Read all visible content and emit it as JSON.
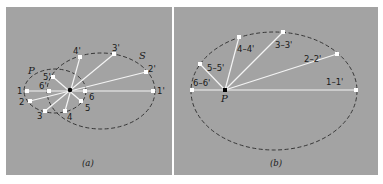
{
  "colors": {
    "background": "#ffffff",
    "panel": "#a3a3a3",
    "line": "#f4f4f4",
    "ellipse": "#2a2a2a",
    "point_fill": "#ffffff",
    "center_point": "#000000"
  },
  "panel_a": {
    "caption": "(a)",
    "ellipse_P_label": "P",
    "ellipse_S_label": "S",
    "points": [
      {
        "label": "1",
        "x": 27,
        "y": 91
      },
      {
        "label": "2",
        "x": 30,
        "y": 101
      },
      {
        "label": "3",
        "x": 45,
        "y": 111
      },
      {
        "label": "4",
        "x": 65,
        "y": 111
      },
      {
        "label": "5",
        "x": 81,
        "y": 101
      },
      {
        "label": "6",
        "x": 85,
        "y": 91
      },
      {
        "label": "1'",
        "x": 153,
        "y": 91
      },
      {
        "label": "2'",
        "x": 146,
        "y": 72
      },
      {
        "label": "3'",
        "x": 114,
        "y": 54
      },
      {
        "label": "4'",
        "x": 80,
        "y": 57
      },
      {
        "label": "5'",
        "x": 53,
        "y": 77
      },
      {
        "label": "6'",
        "x": 49,
        "y": 91
      }
    ]
  },
  "panel_b": {
    "caption": "(b)",
    "focus_label": "P",
    "points": [
      {
        "label": "1–1'",
        "x": 356,
        "y": 90
      },
      {
        "label": "2–2'",
        "x": 337,
        "y": 54
      },
      {
        "label": "3–3'",
        "x": 283,
        "y": 32
      },
      {
        "label": "4–4'",
        "x": 239,
        "y": 37
      },
      {
        "label": "5–5'",
        "x": 200,
        "y": 64
      },
      {
        "label": "6–6'",
        "x": 192,
        "y": 90
      }
    ]
  }
}
